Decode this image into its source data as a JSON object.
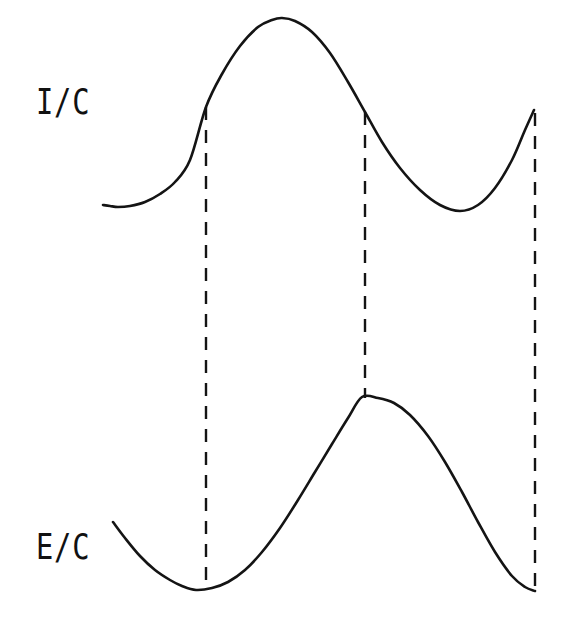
{
  "figure": {
    "background_color": "#ffffff",
    "stroke_color": "#141414",
    "width": 564,
    "height": 621,
    "labels": {
      "upper": "I/C",
      "lower": "E/C"
    }
  },
  "chart_data": {
    "type": "line",
    "title": "",
    "subtitle": "",
    "xlabel": "",
    "ylabel": "",
    "grid": false,
    "legend": "none",
    "axes_visible": false,
    "xlim": [
      0,
      564
    ],
    "ylim": [
      621,
      0
    ],
    "note": "Two vertically stacked waveform traces in screen pixel coordinates (y increases downward). Three dashed vertical tie lines connect corresponding features of the upper and lower traces.",
    "series": [
      {
        "name": "I/C",
        "label": "I/C",
        "stroke": "#141414",
        "dashed": false,
        "x": [
          103,
          110,
          118,
          130,
          145,
          160,
          175,
          190,
          206,
          222,
          240,
          258,
          272,
          282,
          295,
          312,
          330,
          348,
          365,
          382,
          400,
          420,
          440,
          460,
          478,
          495,
          512,
          525,
          534
        ],
        "y": [
          205,
          206,
          207,
          206,
          202,
          194,
          182,
          160,
          107,
          74,
          46,
          27,
          20,
          18,
          21,
          32,
          53,
          82,
          112,
          142,
          168,
          190,
          205,
          211,
          205,
          188,
          160,
          130,
          110
        ]
      },
      {
        "name": "E/C",
        "label": "E/C",
        "stroke": "#141414",
        "dashed": false,
        "x": [
          113,
          125,
          140,
          155,
          170,
          182,
          196,
          212,
          228,
          245,
          262,
          280,
          298,
          315,
          332,
          348,
          362,
          378,
          394,
          410,
          428,
          445,
          462,
          478,
          495,
          512,
          525,
          535
        ],
        "y": [
          522,
          538,
          556,
          570,
          580,
          586,
          590,
          588,
          582,
          570,
          552,
          528,
          500,
          472,
          444,
          418,
          397,
          398,
          403,
          415,
          436,
          462,
          492,
          522,
          552,
          576,
          587,
          591
        ]
      }
    ],
    "tie_lines": [
      {
        "name": "tie-1",
        "x": 206,
        "y_top": 107,
        "y_bottom": 590,
        "style": "dashed"
      },
      {
        "name": "tie-2",
        "x": 365,
        "y_top": 112,
        "y_bottom": 398,
        "style": "dashed"
      },
      {
        "name": "tie-3",
        "x": 535,
        "y_top": 113,
        "y_bottom": 592,
        "style": "dashed"
      }
    ],
    "annotations": [
      {
        "name": "upper-trace-label",
        "text": "I/C",
        "x": 38,
        "y": 102
      },
      {
        "name": "lower-trace-label",
        "text": "E/C",
        "x": 38,
        "y": 548
      }
    ],
    "feature_points": {
      "upper": [
        {
          "name": "start",
          "x": 103,
          "y": 205
        },
        {
          "name": "local-minimum-left",
          "x": 118,
          "y": 207
        },
        {
          "name": "tie-1-crossing",
          "x": 206,
          "y": 107
        },
        {
          "name": "global-maximum",
          "x": 282,
          "y": 18
        },
        {
          "name": "tie-2-crossing",
          "x": 365,
          "y": 112
        },
        {
          "name": "local-minimum-right",
          "x": 460,
          "y": 211
        },
        {
          "name": "end-at-tie-3",
          "x": 534,
          "y": 110
        }
      ],
      "lower": [
        {
          "name": "start",
          "x": 113,
          "y": 522
        },
        {
          "name": "global-minimum-at-tie-1",
          "x": 196,
          "y": 590
        },
        {
          "name": "maximum-at-tie-2",
          "x": 362,
          "y": 397
        },
        {
          "name": "end-at-tie-3",
          "x": 535,
          "y": 591
        }
      ]
    }
  }
}
